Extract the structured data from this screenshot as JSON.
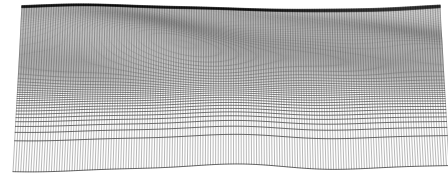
{
  "figure": {
    "title": "",
    "kind": "wireframe-mesh-surface",
    "background_color": "#ffffff",
    "line_color": "#000000",
    "width_px": 448,
    "height_px": 178
  },
  "chart_data": {
    "type": "line",
    "render": "wireframe-mesh",
    "title": "",
    "subtitle": "",
    "xlabel": "",
    "ylabel": "",
    "zlabel": "",
    "grid": false,
    "legend": null,
    "axes_visible": false,
    "tick_labels": [],
    "surface": {
      "nu": 170,
      "nv": 118,
      "u_range": [
        -1.0,
        1.0
      ],
      "v_range": [
        0.0,
        1.0
      ],
      "z_range": [
        -0.42,
        0.46
      ]
    },
    "camera": {
      "horizon_y": 6,
      "near_y": 167,
      "vanish_x": 231,
      "near_half_width": 218,
      "far_half_width": 209,
      "left_margin": 18,
      "right_margin": 13,
      "perspective_exponent": 2.85,
      "elevation_scale": 58
    },
    "shading": {
      "near_alpha": 0.95,
      "far_alpha": 0.42,
      "near_line_width": 0.62,
      "far_line_width": 0.3,
      "horizon_band_darkness": 0.88
    },
    "wave_components": [
      {
        "name": "primary-ridge",
        "amp": 1.0,
        "kx": 2.1,
        "kv": 3.3,
        "phase": 0.35,
        "tilt": 0.55
      },
      {
        "name": "secondary-swell",
        "amp": 0.62,
        "kx": 3.7,
        "kv": 1.9,
        "phase": 2.1,
        "tilt": -0.3
      },
      {
        "name": "cross-ripple",
        "amp": 0.4,
        "kx": 6.2,
        "kv": 5.1,
        "phase": 1.25,
        "tilt": 0.85
      },
      {
        "name": "left-fold",
        "amp": 0.55,
        "kx": 1.3,
        "kv": 6.4,
        "phase": 4.05,
        "tilt": -0.95
      },
      {
        "name": "fine-chop",
        "amp": 0.2,
        "kx": 9.8,
        "kv": 8.3,
        "phase": 0.9,
        "tilt": 0.15
      },
      {
        "name": "far-streak",
        "amp": 0.34,
        "kx": 4.4,
        "kv": 12.0,
        "phase": 3.4,
        "tilt": 1.2
      }
    ],
    "notes": [
      "Near field resolves into an open diamond lattice of mesh quads on white",
      "Mid field shows dark curved trough bands arcing left-to-right",
      "Far field compresses into a near-solid dark horizon band"
    ]
  },
  "elements": {
    "mesh_layer_label": "wireframe-mesh",
    "horizon_label": "horizon-band",
    "near_edge_label": "near-edge"
  }
}
